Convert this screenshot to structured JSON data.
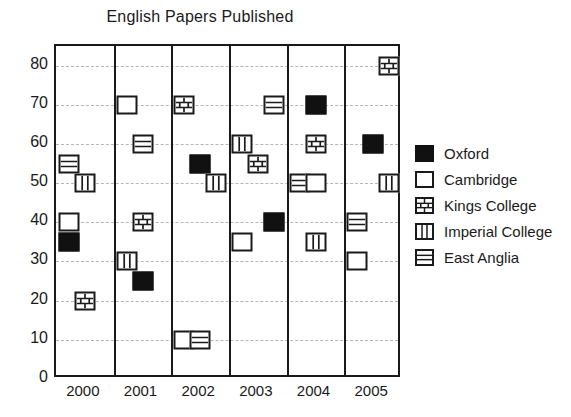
{
  "chart_data": {
    "type": "scatter",
    "title": "English Papers Published",
    "xlabel": "",
    "ylabel": "",
    "categories": [
      "2000",
      "2001",
      "2002",
      "2003",
      "2004",
      "2005"
    ],
    "ylim": [
      0,
      85
    ],
    "yticks": [
      0,
      10,
      20,
      30,
      40,
      50,
      60,
      70,
      80
    ],
    "grid": "horizontal-dashed",
    "legend_position": "right",
    "series": [
      {
        "name": "Oxford",
        "marker": "filled-square",
        "color": "#111111",
        "values": [
          35,
          25,
          55,
          40,
          70,
          60
        ]
      },
      {
        "name": "Cambridge",
        "marker": "empty-square",
        "color": "#ffffff",
        "values": [
          40,
          70,
          10,
          35,
          50,
          30
        ]
      },
      {
        "name": "Kings College",
        "marker": "brick-square",
        "color": "#ffffff",
        "values": [
          20,
          40,
          70,
          55,
          60,
          80
        ]
      },
      {
        "name": "Imperial College",
        "marker": "vertical-stripe-square",
        "color": "#ffffff",
        "values": [
          50,
          30,
          50,
          60,
          35,
          50
        ]
      },
      {
        "name": "East Anglia",
        "marker": "horizontal-stripe-square",
        "color": "#ffffff",
        "values": [
          55,
          60,
          10,
          70,
          50,
          40
        ]
      }
    ],
    "points": [
      {
        "year": "2000",
        "series": "East Anglia",
        "value": 55,
        "slot": 0
      },
      {
        "year": "2000",
        "series": "Imperial College",
        "value": 50,
        "slot": 1
      },
      {
        "year": "2000",
        "series": "Cambridge",
        "value": 40,
        "slot": 0
      },
      {
        "year": "2000",
        "series": "Oxford",
        "value": 35,
        "slot": 0
      },
      {
        "year": "2000",
        "series": "Kings College",
        "value": 20,
        "slot": 1
      },
      {
        "year": "2001",
        "series": "Cambridge",
        "value": 70,
        "slot": 0
      },
      {
        "year": "2001",
        "series": "East Anglia",
        "value": 60,
        "slot": 1
      },
      {
        "year": "2001",
        "series": "Kings College",
        "value": 40,
        "slot": 1
      },
      {
        "year": "2001",
        "series": "Imperial College",
        "value": 30,
        "slot": 0
      },
      {
        "year": "2001",
        "series": "Oxford",
        "value": 25,
        "slot": 1
      },
      {
        "year": "2002",
        "series": "Kings College",
        "value": 70,
        "slot": 0
      },
      {
        "year": "2002",
        "series": "Oxford",
        "value": 55,
        "slot": 1
      },
      {
        "year": "2002",
        "series": "Imperial College",
        "value": 50,
        "slot": 2
      },
      {
        "year": "2002",
        "series": "Cambridge",
        "value": 10,
        "slot": 0
      },
      {
        "year": "2002",
        "series": "East Anglia",
        "value": 10,
        "slot": 1
      },
      {
        "year": "2003",
        "series": "East Anglia",
        "value": 70,
        "slot": 2
      },
      {
        "year": "2003",
        "series": "Imperial College",
        "value": 60,
        "slot": 0
      },
      {
        "year": "2003",
        "series": "Kings College",
        "value": 55,
        "slot": 1
      },
      {
        "year": "2003",
        "series": "Oxford",
        "value": 40,
        "slot": 2
      },
      {
        "year": "2003",
        "series": "Cambridge",
        "value": 35,
        "slot": 0
      },
      {
        "year": "2004",
        "series": "Oxford",
        "value": 70,
        "slot": 1
      },
      {
        "year": "2004",
        "series": "Kings College",
        "value": 60,
        "slot": 1
      },
      {
        "year": "2004",
        "series": "East Anglia",
        "value": 50,
        "slot": 0
      },
      {
        "year": "2004",
        "series": "Cambridge",
        "value": 50,
        "slot": 1
      },
      {
        "year": "2004",
        "series": "Imperial College",
        "value": 35,
        "slot": 1
      },
      {
        "year": "2005",
        "series": "Kings College",
        "value": 80,
        "slot": 2
      },
      {
        "year": "2005",
        "series": "Oxford",
        "value": 60,
        "slot": 1
      },
      {
        "year": "2005",
        "series": "Imperial College",
        "value": 50,
        "slot": 2
      },
      {
        "year": "2005",
        "series": "East Anglia",
        "value": 40,
        "slot": 0
      },
      {
        "year": "2005",
        "series": "Cambridge",
        "value": 30,
        "slot": 0
      }
    ]
  }
}
